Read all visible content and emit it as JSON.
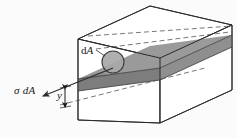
{
  "figure": {
    "type": "technical-line-diagram",
    "canvas": {
      "width": 237,
      "height": 138,
      "background": "#fbfbfb"
    },
    "labels": {
      "stress_force": "σ dA",
      "stress_force_symbol": "σ",
      "stress_force_area": "dA",
      "area_element_d": "d",
      "area_element_A": "A",
      "area_element": "dA",
      "distance": "y"
    },
    "colors": {
      "outline": "#2b2b2b",
      "plane_fill_top": "#9a9a9a",
      "plane_fill_front": "#7d7d7d",
      "plane_fill_left": "#8c8c8c",
      "circle_fill": "#a8a8a8",
      "circle_stroke": "#3a3a3a",
      "face_fill": "#ffffff",
      "background": "#fbfbfb",
      "label_color": "#1a1a1a"
    },
    "geometry": {
      "description": "Rectangular prism (beam segment) drawn in oblique projection with a horizontal neutral-axis plane shaded gray",
      "front_face": {
        "top_left": [
          78,
          39
        ],
        "top_right": [
          160,
          58
        ],
        "bottom_right": [
          160,
          123
        ],
        "bottom_left": [
          78,
          120
        ]
      },
      "depth_offset": [
        72,
        -33
      ],
      "neutral_plane_y_front_left": 79,
      "neutral_plane_y_front_right": 68,
      "band_thickness_px": 12
    },
    "elements": {
      "area_circle": {
        "cx": 113,
        "cy": 62,
        "r": 11
      },
      "force_arrow": {
        "tail": [
          101,
          72
        ],
        "tip": [
          42,
          96
        ],
        "direction": "down-left"
      },
      "dimension_arrow_y": {
        "x": 65,
        "top": 88,
        "bottom": 107,
        "style": "double-headed"
      },
      "leader_da": {
        "from": [
          96,
          50
        ],
        "to": [
          106,
          57
        ]
      },
      "dashed_lines": 3
    }
  }
}
